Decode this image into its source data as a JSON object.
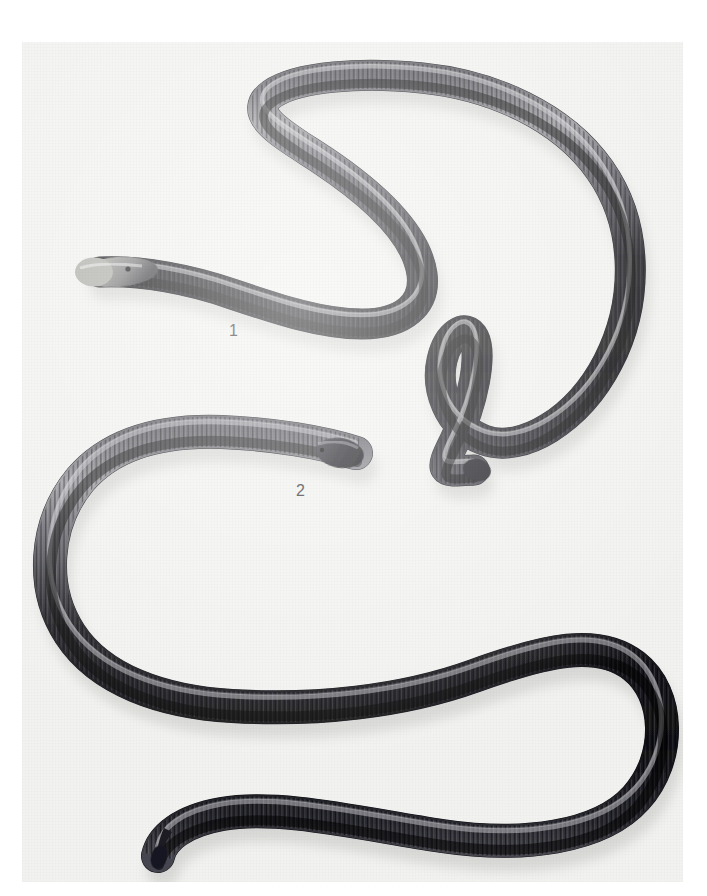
{
  "figure": {
    "kind": "natural-history-specimen-plate",
    "background_color": "#f2f2f0",
    "page_color": "#ffffff",
    "photo_area": {
      "x": 22,
      "y": 42,
      "width": 661,
      "height": 840
    },
    "label_color": "#2e2e2e",
    "body_dark_color": "#14141a",
    "body_mid_color": "#3a3a42",
    "body_highlight_color": "#b9b9bd",
    "head_light_color": "#a9a9a4",
    "shadow_color": "#c9c9c6"
  },
  "labels": [
    {
      "id": "1",
      "text": "1",
      "x": 237,
      "y": 332
    },
    {
      "id": "2",
      "text": "2",
      "x": 304,
      "y": 492
    }
  ],
  "specimens": [
    {
      "id": "specimen-1",
      "label": "1",
      "description": "Elongate limbless amphibian, pale rounded head at left, dark annulated body in a broad S-curve, blunt tail at lower right",
      "head": {
        "x": 100,
        "y": 272,
        "color": "#a9a9a4",
        "eye_x": 128,
        "eye_y": 268
      },
      "tail": {
        "x": 495,
        "y": 470,
        "shape": "blunt-hooked"
      },
      "annuli_visible": true
    },
    {
      "id": "specimen-2",
      "label": "2",
      "description": "Elongate limbless amphibian, dark pointed head at upper right of coil, body loops into a U at left then a large loop at right, tapering pointed tail at lower left",
      "head": {
        "x": 355,
        "y": 452,
        "color": "#1b1b20",
        "eye_x": 322,
        "eye_y": 449
      },
      "tail": {
        "x": 158,
        "y": 855,
        "shape": "tapered-point"
      },
      "annuli_visible": true
    }
  ]
}
